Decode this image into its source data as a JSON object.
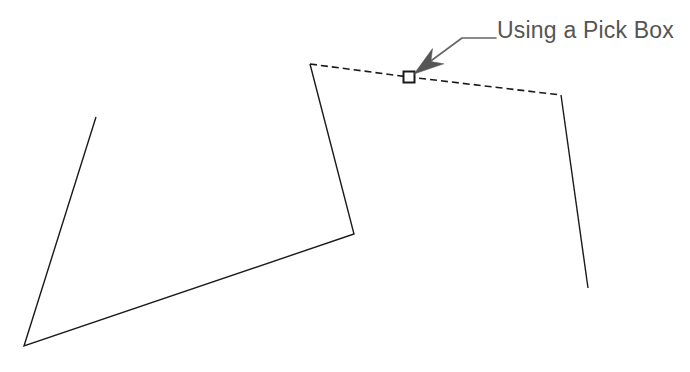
{
  "canvas": {
    "width": 690,
    "height": 372,
    "background_color": "#ffffff"
  },
  "annotation": {
    "label": "Using a Pick Box",
    "label_color": "#555555",
    "label_x": 497,
    "label_y": 38,
    "leader_color": "#666666",
    "leader_horizontal": {
      "x1": 496,
      "y1": 38,
      "x2": 462,
      "y2": 38
    },
    "leader_diagonal": {
      "x1": 462,
      "y1": 38,
      "x2": 424,
      "y2": 66
    },
    "arrowhead_name": "arrowhead",
    "arrowhead_tip": {
      "x": 414,
      "y": 74
    }
  },
  "pick_box": {
    "name": "pick-box-marker",
    "center_x": 409,
    "center_y": 77,
    "size": 11,
    "stroke_color": "#1a1a1a",
    "fill_color": "#ffffff",
    "stroke_width": 2
  },
  "geometry": {
    "stroke_color": "#1a1a1a",
    "stroke_width": 1.4,
    "dash_pattern": "7 4",
    "solid_polyline_left": {
      "name": "left-open-polygon",
      "points": "96,117 24,346 354,234 310,64"
    },
    "dashed_segment": {
      "name": "selected-edge-dashed",
      "points": "310,64 409,77 561,95"
    },
    "solid_polyline_right": {
      "name": "right-edge-line",
      "points": "561,95 588,288"
    }
  }
}
